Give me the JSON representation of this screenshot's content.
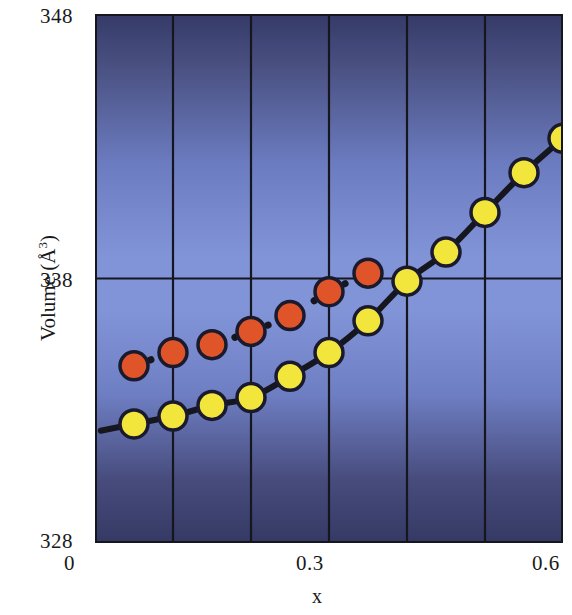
{
  "chart_data": {
    "type": "line",
    "title": "",
    "xlabel": "x",
    "ylabel": "Volume (Å³)",
    "xlim": [
      0,
      0.6
    ],
    "ylim": [
      328,
      348
    ],
    "xticks": [
      0,
      0.3,
      0.6
    ],
    "xtick_labels": [
      "0",
      "0.3",
      "0.6"
    ],
    "yticks": [
      328,
      338,
      348
    ],
    "ytick_labels": [
      "328",
      "338",
      "348"
    ],
    "grid": true,
    "gridlines_x": [
      0.1,
      0.2,
      0.3,
      0.4,
      0.5
    ],
    "gridlines_y": [
      338
    ],
    "legend": null,
    "legend_position": "none",
    "plot_background": "gradient-blue",
    "series": [
      {
        "name": "yellow-series",
        "marker": "circle",
        "marker_color": "#f2e63c",
        "marker_edge_color": "#1a1a2e",
        "line_style": "solid",
        "line_color": "#16161f",
        "x": [
          0.05,
          0.1,
          0.15,
          0.2,
          0.25,
          0.3,
          0.35,
          0.4,
          0.45,
          0.5,
          0.55,
          0.6
        ],
        "values": [
          332.5,
          332.8,
          333.2,
          333.5,
          334.3,
          335.2,
          336.4,
          337.9,
          339.0,
          340.5,
          342.0,
          343.3
        ]
      },
      {
        "name": "red-series",
        "marker": "circle",
        "marker_color": "#e0542a",
        "marker_edge_color": "#1a1a2e",
        "line_style": "dotted",
        "line_color": "#16161f",
        "x": [
          0.05,
          0.1,
          0.15,
          0.2,
          0.25,
          0.3,
          0.35
        ],
        "values": [
          334.7,
          335.2,
          335.5,
          336.0,
          336.6,
          337.5,
          338.2
        ]
      }
    ]
  },
  "axis": {
    "y_top": "348",
    "y_mid": "338",
    "y_bottom": "328",
    "x_left": "0",
    "x_mid": "0.3",
    "x_right": "0.6",
    "x_title": "x",
    "y_title_text": "Volume (Å",
    "y_title_sup": "3",
    "y_title_tail": ")"
  },
  "colors": {
    "marker_yellow": "#f2e63c",
    "marker_red": "#e0542a",
    "marker_edge": "#1a1a2e",
    "line": "#16161f",
    "plot_border": "#16161f",
    "bg_dark": "#3b3f6e",
    "bg_light": "#8193d6",
    "text": "#1a1a1a"
  }
}
